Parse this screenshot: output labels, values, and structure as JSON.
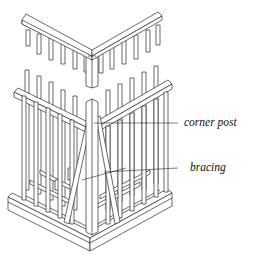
{
  "diagram": {
    "labels": [
      {
        "id": "corner_post",
        "text": "corner post"
      },
      {
        "id": "bracing",
        "text": "bracing"
      }
    ],
    "colors": {
      "line": "#2a2a2a",
      "fill": "#ffffff",
      "shade": "#e8e8e8"
    }
  }
}
